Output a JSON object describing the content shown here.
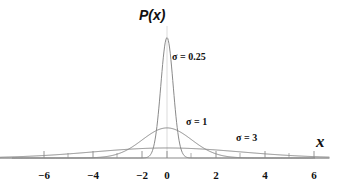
{
  "figure": {
    "width": 337,
    "height": 191,
    "background": "#ffffff"
  },
  "labels": {
    "y_axis_title": "P(x)",
    "x_axis_title": "x"
  },
  "annotations": [
    {
      "text": "σ = 0.25",
      "x": 172,
      "y": 52
    },
    {
      "text": "σ = 1",
      "x": 186,
      "y": 117
    },
    {
      "text": "σ = 3",
      "x": 236,
      "y": 133
    }
  ],
  "colors": {
    "curve": "#8a8a8a",
    "axis": "#8a8a8a",
    "gridline": "#cccccc",
    "text": "#111111",
    "background": "#ffffff"
  },
  "chart_data": {
    "type": "line",
    "title": "P(x)",
    "xlabel": "x",
    "ylabel": "P(x)",
    "xlim": [
      -6.8,
      6.6
    ],
    "ylim": [
      0,
      1.75
    ],
    "grid": false,
    "legend": "inline-annotations",
    "x_ticks_major": [
      -6,
      -4,
      -2,
      0,
      2,
      4,
      6
    ],
    "x_tick_labels": [
      "−6",
      "−4",
      "−2",
      "0",
      "2",
      "4",
      "6"
    ],
    "x_ticks_minor": [
      -5,
      -3,
      -1,
      1,
      3,
      5
    ],
    "y_ticks": [],
    "series": [
      {
        "name": "σ = 0.25",
        "sigma": 0.25,
        "mu": 0,
        "peak_value": 1.596,
        "x": [
          -1.5,
          -1.25,
          -1.0,
          -0.75,
          -0.625,
          -0.5,
          -0.375,
          -0.25,
          -0.125,
          0,
          0.125,
          0.25,
          0.375,
          0.5,
          0.625,
          0.75,
          1.0,
          1.25,
          1.5
        ],
        "values": [
          0.0,
          0.0,
          0.0001,
          0.0088,
          0.0362,
          0.108,
          0.2346,
          0.3679,
          0.4169,
          0.4339,
          0.4169,
          0.3679,
          0.2346,
          0.108,
          0.0362,
          0.0088,
          0.0001,
          0.0,
          0.0
        ]
      },
      {
        "name": "σ = 1",
        "sigma": 1,
        "mu": 0,
        "peak_value": 0.399,
        "x": [
          -4,
          -3.5,
          -3,
          -2.5,
          -2,
          -1.5,
          -1,
          -0.5,
          0,
          0.5,
          1,
          1.5,
          2,
          2.5,
          3,
          3.5,
          4
        ],
        "values": [
          0.0001,
          0.0009,
          0.0044,
          0.0175,
          0.054,
          0.1295,
          0.242,
          0.3521,
          0.3989,
          0.3521,
          0.242,
          0.1295,
          0.054,
          0.0175,
          0.0044,
          0.0009,
          0.0001
        ]
      },
      {
        "name": "σ = 3",
        "sigma": 3,
        "mu": 0,
        "peak_value": 0.133,
        "x": [
          -6.5,
          -6,
          -5,
          -4,
          -3,
          -2,
          -1,
          0,
          1,
          2,
          3,
          4,
          5,
          6,
          6.5
        ],
        "values": [
          0.0172,
          0.018,
          0.0547,
          0.0547,
          0.0807,
          0.1065,
          0.1258,
          0.133,
          0.1258,
          0.1065,
          0.0807,
          0.0547,
          0.0298,
          0.018,
          0.0172
        ]
      }
    ]
  },
  "axis_geometry": {
    "baseline_y": 158,
    "x_left_px": 12,
    "x_right_px": 315,
    "origin_px": 167,
    "px_per_unit": 24.6
  },
  "tick_labels": [
    {
      "text": "−6",
      "x": 44
    },
    {
      "text": "−4",
      "x": 93
    },
    {
      "text": "−2",
      "x": 142
    },
    {
      "text": "0",
      "x": 167
    },
    {
      "text": "2",
      "x": 216
    },
    {
      "text": "4",
      "x": 265
    },
    {
      "text": "6",
      "x": 314
    }
  ]
}
